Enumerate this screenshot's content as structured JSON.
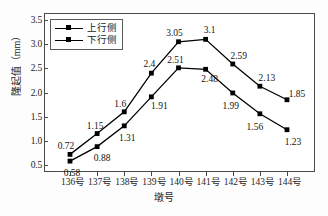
{
  "chart_data": {
    "type": "line",
    "title": "",
    "xlabel": "墩号",
    "ylabel": "隆起值（mm）",
    "categories": [
      "136号",
      "137号",
      "138号",
      "139号",
      "140号",
      "141号",
      "142号",
      "143号",
      "144号"
    ],
    "ylim": [
      0.5,
      3.5
    ],
    "ytick_labels": [
      "0.5",
      "1.0",
      "1.5",
      "2.0",
      "2.5",
      "3.0",
      "3.5"
    ],
    "ytick_values": [
      0.5,
      1.0,
      1.5,
      2.0,
      2.5,
      3.0,
      3.5
    ],
    "grid": false,
    "legend_position": "top-left",
    "marker": "square",
    "line_color": "#000000",
    "series": [
      {
        "name": "上行侧",
        "marker": "square",
        "values": [
          0.72,
          1.15,
          1.6,
          2.4,
          3.05,
          3.1,
          2.59,
          2.13,
          1.85
        ],
        "labels": [
          "0.72",
          "1.15",
          "1.6",
          "2.4",
          "3.05",
          "3.1",
          "2.59",
          "2.13",
          "1.85"
        ]
      },
      {
        "name": "下行侧",
        "marker": "square",
        "values": [
          0.58,
          0.88,
          1.31,
          1.91,
          2.51,
          2.48,
          1.99,
          1.56,
          1.23
        ],
        "labels": [
          "0.58",
          "0.88",
          "1.31",
          "1.91",
          "2.51",
          "2.48",
          "1.99",
          "1.56",
          "1.23"
        ]
      }
    ]
  },
  "legend": {
    "items": [
      {
        "label": "上行侧"
      },
      {
        "label": "下行侧"
      }
    ]
  },
  "axes": {
    "y_title": "隆起值（mm）",
    "x_title": "墩号"
  }
}
